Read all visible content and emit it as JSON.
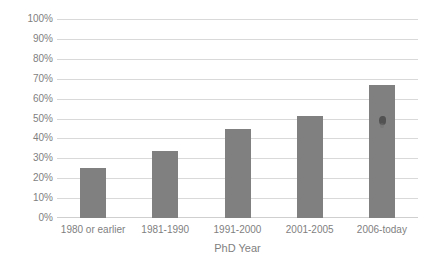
{
  "chart_data": {
    "type": "bar",
    "title": "",
    "subtitle": "",
    "xlabel": "PhD Year",
    "ylabel": "",
    "categories": [
      "1980 or earlier",
      "1981-1990",
      "1991-2000",
      "2001-2005",
      "2006-today"
    ],
    "values": [
      25,
      33.5,
      44.5,
      51.5,
      67
    ],
    "value_labels": [
      "25%",
      "34%",
      "44%",
      "52%",
      "67%"
    ],
    "ylim": [
      0,
      100
    ],
    "ytick_values": [
      0,
      10,
      20,
      30,
      40,
      50,
      60,
      70,
      80,
      90,
      100
    ],
    "ytick_labels": [
      "0%",
      "10%",
      "20%",
      "30%",
      "40%",
      "50%",
      "60%",
      "70%",
      "80%",
      "90%",
      "100%"
    ],
    "grid": true,
    "grid_axis": "y",
    "legend": false,
    "legend_position": "none",
    "series": [
      {
        "name": "",
        "color": "#808080",
        "values": [
          25,
          33.5,
          44.5,
          51.5,
          67
        ]
      }
    ],
    "colors": {
      "bar": "#808080",
      "gridline": "#d9d9d9",
      "baseline": "#cfcfcf",
      "tick_text": "#7f7f7f",
      "background": "#ffffff"
    },
    "annotations": [
      {
        "name": "ink-smudge-artifact",
        "category": "2006-today",
        "approx_value": 49,
        "description": "small dark scan smudge on fifth bar"
      }
    ]
  }
}
